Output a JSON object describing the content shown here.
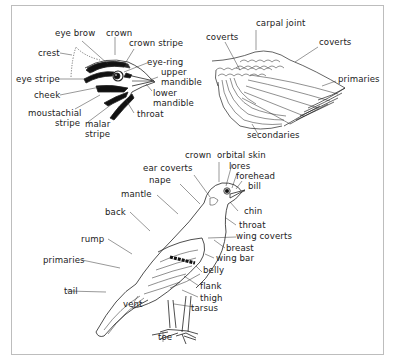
{
  "diagram": {
    "type": "bird topography",
    "colors": {
      "ink": "#222222",
      "frame": "#bdbdbd",
      "background": "#ffffff"
    },
    "panels": {
      "head": {
        "labels": {
          "eye_brow": "eye brow",
          "crown": "crown",
          "crown_stripe": "crown stripe",
          "crest": "crest",
          "eye_ring": "eye-ring",
          "eye_stripe": "eye stripe",
          "upper_mandible": "upper\nmandible",
          "upper_mandible_1": "upper",
          "upper_mandible_2": "mandible",
          "cheek": "cheek",
          "lower_mandible_1": "lower",
          "lower_mandible_2": "mandible",
          "moustachial_stripe_1": "moustachial",
          "moustachial_stripe_2": "stripe",
          "throat": "throat",
          "malar_stripe_1": "malar",
          "malar_stripe_2": "stripe"
        }
      },
      "wing": {
        "labels": {
          "carpal_joint": "carpal joint",
          "coverts_left": "coverts",
          "coverts_right": "coverts",
          "primaries": "primaries",
          "secondaries": "secondaries"
        }
      },
      "body": {
        "labels": {
          "crown": "crown",
          "orbital_skin": "orbital skin",
          "ear_coverts": "ear coverts",
          "lores": "lores",
          "forehead": "forehead",
          "nape": "nape",
          "bill": "bill",
          "mantle": "mantle",
          "back": "back",
          "chin": "chin",
          "throat": "throat",
          "wing_coverts": "wing coverts",
          "breast": "breast",
          "rump": "rump",
          "wing_bar": "wing bar",
          "primaries": "primaries",
          "belly": "belly",
          "flank": "flank",
          "tail": "tail",
          "thigh": "thigh",
          "vent": "vent",
          "tarsus": "tarsus",
          "toe": "toe"
        }
      }
    }
  }
}
